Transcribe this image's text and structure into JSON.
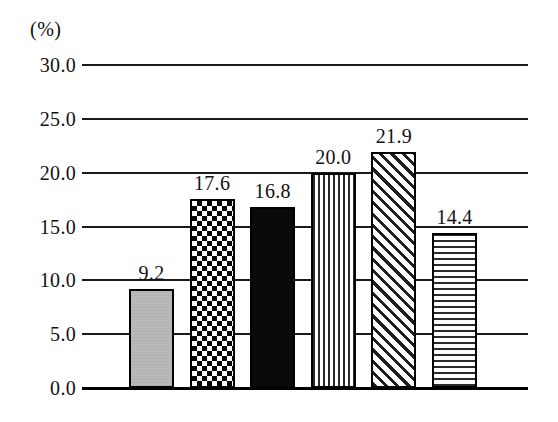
{
  "chart_data": {
    "type": "bar",
    "title": "",
    "subtitle": "",
    "xlabel": "",
    "ylabel": "(%)",
    "unit_label": "(%)",
    "ylim": [
      0.0,
      30.0
    ],
    "ytick_step": 5.0,
    "grid": true,
    "legend": "none",
    "x_axis_tick_labels": false,
    "categories": [
      "1",
      "2",
      "3",
      "4",
      "5",
      "6"
    ],
    "values": [
      9.2,
      17.6,
      16.8,
      20.0,
      21.9,
      14.4
    ],
    "value_labels": [
      "9.2",
      "17.6",
      "16.8",
      "20.0",
      "21.9",
      "14.4"
    ],
    "ytick_labels": [
      "30.0",
      "25.0",
      "20.0",
      "15.0",
      "10.0",
      "5.0",
      "0.0"
    ],
    "ytick_values": [
      30.0,
      25.0,
      20.0,
      15.0,
      10.0,
      5.0,
      0.0
    ],
    "bar_patterns": [
      "solid-gray",
      "checkerboard",
      "solid-black",
      "vertical-stripes",
      "diagonal-hatch",
      "horizontal-stripes"
    ],
    "colors": {
      "axis": "#1a1a1a",
      "gridline": "#1a1a1a",
      "text": "#111111",
      "bar_1_fill": "#b9b9b9",
      "bar_3_fill": "#0a0a0a",
      "bar_outline": "#000000",
      "background": "#ffffff"
    }
  }
}
